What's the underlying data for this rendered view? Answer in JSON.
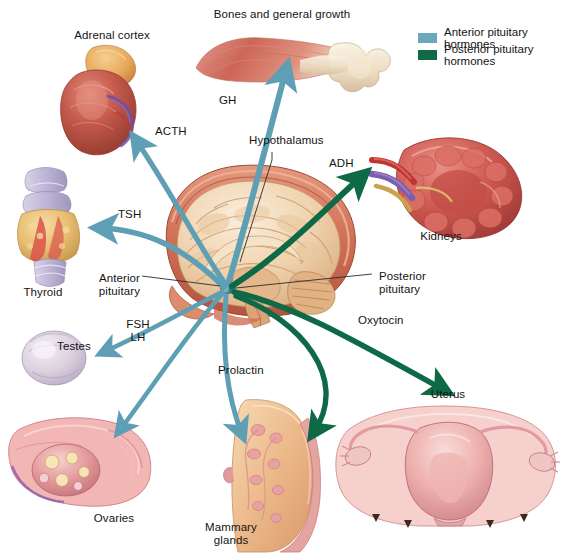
{
  "figure": {
    "type": "anatomical-diagram"
  },
  "legend": {
    "items": [
      {
        "label": "Anterior pituitary hormones",
        "color": "#6aa8bc"
      },
      {
        "label": "Posterior pituitary hormones",
        "color": "#0f6b47"
      }
    ]
  },
  "colors": {
    "anterior": "#5e9fb5",
    "posterior": "#0e6a46",
    "leader": "#2b2b2b",
    "text": "#141414"
  },
  "structures": {
    "bones": "Bones and general growth",
    "adrenal": "Adrenal cortex",
    "thyroid": "Thyroid",
    "testes": "Testes",
    "ovaries": "Ovaries",
    "mammary": "Mammary\nglands",
    "uterus": "Uterus",
    "kidneys": "Kidneys",
    "hypothalamus": "Hypothalamus",
    "anterior_pituitary": "Anterior\npituitary",
    "posterior_pituitary": "Posterior\npituitary"
  },
  "hormones": {
    "gh": "GH",
    "acth": "ACTH",
    "tsh": "TSH",
    "fsh_lh": "FSH\nLH",
    "prolactin": "Prolactin",
    "adh": "ADH",
    "oxytocin": "Oxytocin"
  }
}
